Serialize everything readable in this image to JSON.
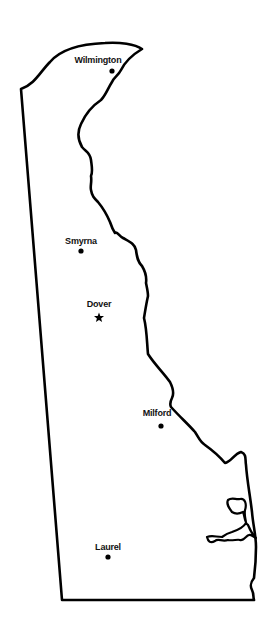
{
  "map": {
    "region": "Delaware",
    "outline_color": "#000000",
    "background": "#ffffff",
    "cities": [
      {
        "name": "Wilmington",
        "marker": "dot",
        "label_x": 98,
        "label_y": 55,
        "x": 112,
        "y": 71
      },
      {
        "name": "Smyrna",
        "marker": "dot",
        "label_x": 81,
        "label_y": 236,
        "x": 81,
        "y": 251
      },
      {
        "name": "Dover",
        "marker": "star",
        "label_x": 99,
        "label_y": 299,
        "x": 99,
        "y": 317,
        "capital": true
      },
      {
        "name": "Milford",
        "marker": "dot",
        "label_x": 157,
        "label_y": 408,
        "x": 161,
        "y": 426
      },
      {
        "name": "Laurel",
        "marker": "dot",
        "label_x": 108,
        "label_y": 542,
        "x": 108,
        "y": 557
      }
    ]
  }
}
